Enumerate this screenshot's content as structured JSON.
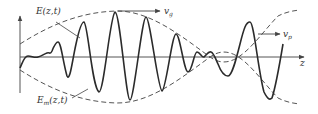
{
  "diagram": {
    "labels": {
      "carrier": "E(z,t)",
      "envelope_main": "E",
      "envelope_sub": "m",
      "envelope_args": "(z,t)",
      "group_velocity_main": "v",
      "group_velocity_sub": "g",
      "phase_velocity_main": "v",
      "phase_velocity_sub": "p",
      "axis_z": "z"
    },
    "colors": {
      "wave": "#2b2b2b",
      "envelope": "#444444",
      "axis": "#555555"
    }
  }
}
